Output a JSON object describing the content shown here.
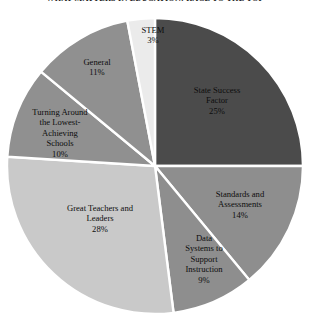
{
  "title": "WHAT MATTERS IN EDUCATION: RACE TO THE TOP",
  "chart_data": {
    "type": "pie",
    "title": "WHAT MATTERS IN EDUCATION: RACE TO THE TOP",
    "xlabel": "",
    "ylabel": "",
    "legend_position": "none",
    "labels_on_slices": true,
    "grid": false,
    "start_angle_deg": -90,
    "direction": "clockwise",
    "separator_color": "#ffffff",
    "categories": [
      "State Success Factor",
      "Standards and Assessments",
      "Data Systems to Support Instruction",
      "Great Teachers and Leaders",
      "Turning Around the Lowest-Achieving Schools",
      "General",
      "STEM"
    ],
    "values": [
      25,
      14,
      9,
      28,
      10,
      11,
      3
    ],
    "unit": "%",
    "colors": [
      "#4b4b4b",
      "#8e8e8e",
      "#8e8e8e",
      "#c9c9c9",
      "#909090",
      "#909090",
      "#ebebeb"
    ]
  },
  "slices": [
    {
      "name": "state-success-factor",
      "label_lines": [
        "State Success",
        "Factor"
      ],
      "value_text": "25%",
      "color": "#4b4b4b"
    },
    {
      "name": "standards-and-assessments",
      "label_lines": [
        "Standards and",
        "Assessments"
      ],
      "value_text": "14%",
      "color": "#8e8e8e"
    },
    {
      "name": "data-systems-to-support-instruction",
      "label_lines": [
        "Data",
        "Systems to",
        "Support",
        "Instruction"
      ],
      "value_text": "9%",
      "color": "#8e8e8e"
    },
    {
      "name": "great-teachers-and-leaders",
      "label_lines": [
        "Great Teachers and",
        "Leaders"
      ],
      "value_text": "28%",
      "color": "#c9c9c9"
    },
    {
      "name": "turning-around-the-lowest-achieving-schools",
      "label_lines": [
        "Turning Around",
        "the Lowest-",
        "Achieving",
        "Schools"
      ],
      "value_text": "10%",
      "color": "#909090"
    },
    {
      "name": "general",
      "label_lines": [
        "General"
      ],
      "value_text": "11%",
      "color": "#909090"
    },
    {
      "name": "stem",
      "label_lines": [
        "STEM"
      ],
      "value_text": "3%",
      "color": "#ebebeb"
    }
  ],
  "labels": {
    "stem_name": "STEM",
    "stem_value": "3%",
    "ssf_l1": "State Success",
    "ssf_l2": "Factor",
    "ssf_value": "25%",
    "general_name": "General",
    "general_value": "11%",
    "turning_l1": "Turning Around",
    "turning_l2": "the Lowest-",
    "turning_l3": "Achieving",
    "turning_l4": "Schools",
    "turning_value": "10%",
    "great_l1": "Great Teachers and",
    "great_l2": "Leaders",
    "great_value": "28%",
    "data_l1": "Data",
    "data_l2": "Systems to",
    "data_l3": "Support",
    "data_l4": "Instruction",
    "data_value": "9%",
    "standards_l1": "Standards and",
    "standards_l2": "Assessments",
    "standards_value": "14%"
  }
}
